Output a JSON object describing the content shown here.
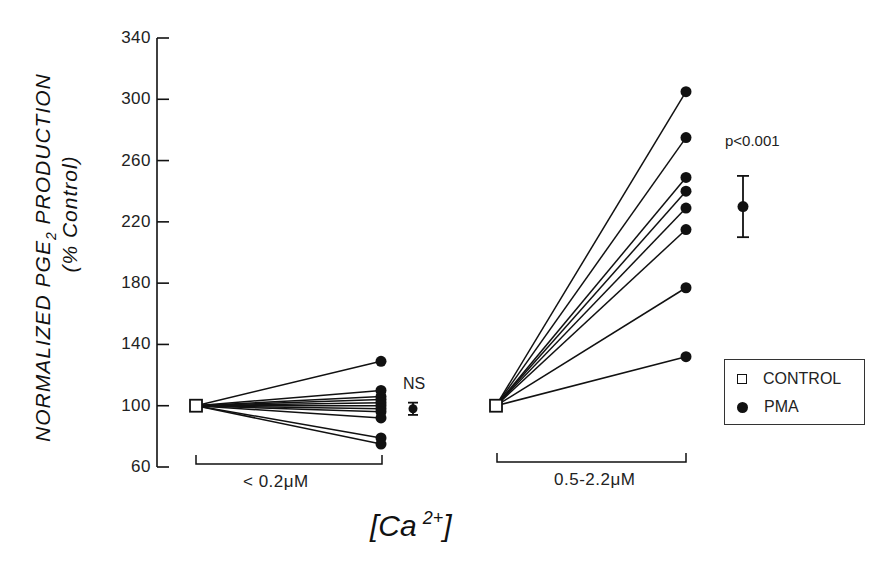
{
  "chart_data": {
    "type": "line",
    "subtype": "paired before-after plot",
    "title": "",
    "ylabel": "NORMALIZED PGE2 PRODUCTION",
    "ylabel_line2": "(% Control)",
    "xlabel": "[Ca 2+]",
    "ylim": [
      60,
      340
    ],
    "yticks": [
      60,
      100,
      140,
      180,
      220,
      260,
      300,
      340
    ],
    "grid": false,
    "legend_position": "right",
    "legend": [
      {
        "name": "CONTROL",
        "marker": "open-square"
      },
      {
        "name": "PMA",
        "marker": "filled-circle"
      }
    ],
    "groups": [
      {
        "label": "< 0.2μM",
        "control_value": 100,
        "pma_values": [
          129,
          110,
          106,
          104,
          102,
          100,
          98,
          96,
          92,
          79,
          75
        ],
        "summary": {
          "mean": 98,
          "error_low": 94,
          "error_high": 102,
          "annotation": "NS"
        }
      },
      {
        "label": "0.5-2.2μM",
        "control_value": 100,
        "pma_values": [
          305,
          275,
          249,
          240,
          229,
          215,
          177,
          132
        ],
        "summary": {
          "mean": 230,
          "error_low": 210,
          "error_high": 250,
          "annotation": "p<0.001"
        }
      }
    ]
  },
  "labels": {
    "ylabel_line1": "NORMALIZED PGE",
    "ylabel_sub": "2",
    "ylabel_line1_end": " PRODUCTION",
    "ylabel_line2": "(% Control)",
    "group1": "< 0.2μM",
    "group2": "0.5-2.2μM",
    "xtitle_base": "[Ca",
    "xtitle_sup": "2+",
    "xtitle_close": "]",
    "ns": "NS",
    "pval": "p<0.001",
    "legend_control": "CONTROL",
    "legend_pma": "PMA"
  },
  "colors": {
    "ink": "#111111",
    "background": "#ffffff"
  }
}
